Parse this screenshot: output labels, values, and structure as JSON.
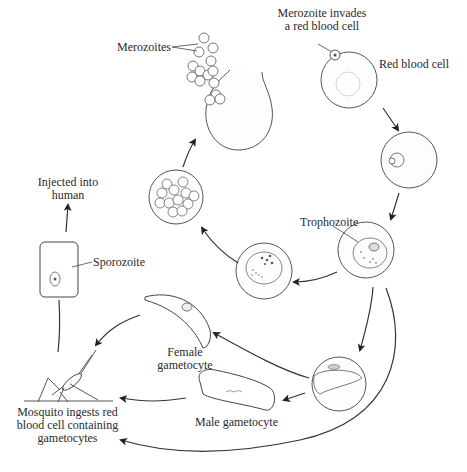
{
  "diagram": {
    "labels": {
      "merozoites": "Merozoites",
      "merozoite_invades_line1": "Merozoite invades",
      "merozoite_invades_line2": "a red blood cell",
      "red_blood_cell": "Red blood cell",
      "trophozoite": "Trophozoite",
      "injected_line1": "Injected into",
      "injected_line2": "human",
      "sporozoite": "Sporozoite",
      "female_line1": "Female",
      "female_line2": "gametocyte",
      "male_gametocyte": "Male gametocyte",
      "mosquito_line1": "Mosquito ingests red",
      "mosquito_line2": "blood cell containing",
      "mosquito_line3": "gametocytes"
    },
    "stages": [
      "Merozoite invades a red blood cell",
      "Red blood cell",
      "Early ring stage",
      "Trophozoite",
      "Schizont",
      "Segmented schizont",
      "Merozoites released",
      "Female gametocyte",
      "Male gametocyte",
      "Mosquito ingests red blood cell containing gametocytes",
      "Sporozoite",
      "Injected into human"
    ],
    "colors": {
      "line": "#333333",
      "cell_outline": "#555555",
      "background": "#ffffff"
    }
  }
}
